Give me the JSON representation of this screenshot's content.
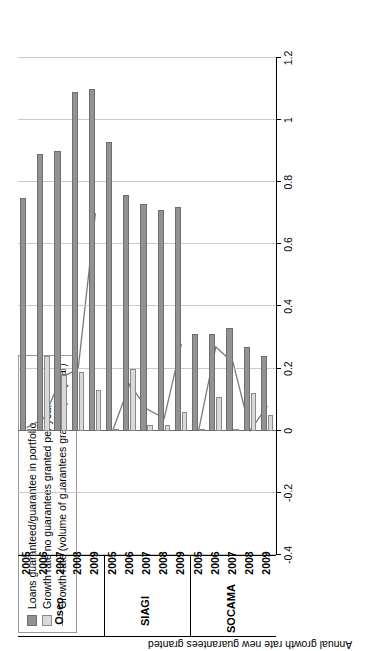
{
  "chart_data": {
    "type": "bar",
    "title": "",
    "xlabel": "",
    "ylabel": "Annual growth rate new guarantees granted",
    "ylim": [
      -0.4,
      1.2
    ],
    "yticks": [
      1.2,
      1,
      0.8,
      0.6,
      0.4,
      0.2,
      0,
      -0.2,
      -0.4
    ],
    "ytick_labels": [
      "1.2",
      "1",
      "0.8",
      "0.6",
      "0.4",
      "0.2",
      "0",
      "-0.2",
      "-0.4"
    ],
    "grid": true,
    "legend_position": "top-left",
    "orientation": "rotated-90",
    "groups": [
      "Oseo",
      "SIAGI",
      "SOCAMA"
    ],
    "categories": [
      "2005",
      "2006",
      "2007",
      "2008",
      "2009"
    ],
    "series": [
      {
        "name": "Loans guaranteed/guarantee in portfolio",
        "key": "dark",
        "color": "#929292",
        "type": "bar",
        "values_by_group": {
          "Oseo": [
            0.75,
            0.89,
            0.9,
            1.09,
            1.1
          ],
          "SIAGI": [
            0.93,
            0.76,
            0.73,
            0.71,
            0.72
          ],
          "SOCAMA": [
            0.31,
            0.31,
            0.33,
            0.27,
            0.24
          ]
        }
      },
      {
        "name": "Growth rate no guarantees granted per year",
        "key": "light",
        "color": "#d9d9d9",
        "type": "bar",
        "values_by_group": {
          "Oseo": [
            0.0,
            0.24,
            0.18,
            0.19,
            0.13
          ],
          "SIAGI": [
            0.0,
            0.2,
            0.02,
            0.02,
            0.06
          ],
          "SOCAMA": [
            0.0,
            0.11,
            0.0,
            0.12,
            0.05
          ]
        }
      },
      {
        "name": "Growth rate (volume of guarantees granted per year)",
        "key": "line",
        "color": "#7a7a7a",
        "type": "line",
        "values_by_group": {
          "Oseo": [
            0.01,
            0.04,
            0.17,
            0.2,
            0.7
          ],
          "SIAGI": [
            0.0,
            0.15,
            0.07,
            0.04,
            0.28
          ],
          "SOCAMA": [
            0.0,
            0.27,
            0.22,
            0.0,
            0.08
          ]
        }
      }
    ]
  },
  "legend": {
    "items": [
      {
        "label": "Loans guaranteed/guarantee in portfolio",
        "swatch": "dark"
      },
      {
        "label": "Growth rate no guarantees granted per year",
        "swatch": "light"
      },
      {
        "label": "Growth rate (volume of guarantees granted per year)",
        "swatch": "line"
      }
    ]
  },
  "axes": {
    "value_axis_title": "Annual growth rate new guarantees granted",
    "value_tick_labels": [
      "1.2",
      "1",
      "0.8",
      "0.6",
      "0.4",
      "0.2",
      "0",
      "-0.2",
      "-0.4"
    ],
    "category_labels": [
      "2005",
      "2006",
      "2007",
      "2008",
      "2009"
    ],
    "group_labels": [
      "Oseo",
      "SIAGI",
      "SOCAMA"
    ]
  }
}
